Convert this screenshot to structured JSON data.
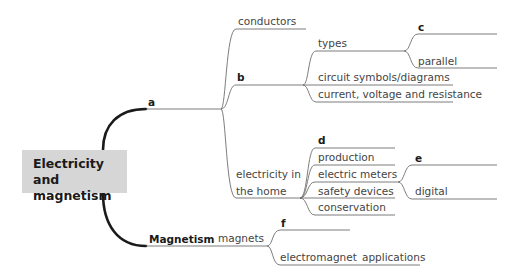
{
  "central": {
    "line1": "Electricity and",
    "line2": "magnetism"
  },
  "branches": {
    "a": {
      "label": "a",
      "children": {
        "conductors": "conductors",
        "b": {
          "label": "b",
          "types": {
            "label": "types",
            "c": "c",
            "parallel": "parallel"
          },
          "circuit": "circuit symbols/diagrams",
          "current": "current, voltage and resistance"
        },
        "home": {
          "line1": "electricity in",
          "line2": "the home",
          "d": "d",
          "production": "production",
          "meters": {
            "label": "electric meters",
            "e": "e",
            "digital": "digital"
          },
          "safety": "safety devices",
          "conservation": "conservation"
        }
      }
    },
    "magnetism": {
      "label": "Magnetism",
      "magnets": "magnets",
      "f": "f",
      "electromagnet": "electromagnet",
      "applications": "applications"
    }
  },
  "colors": {
    "thick_line": "#1a1a1a",
    "thin_line": "#6a6a6a",
    "box": "#d6d6d6"
  }
}
